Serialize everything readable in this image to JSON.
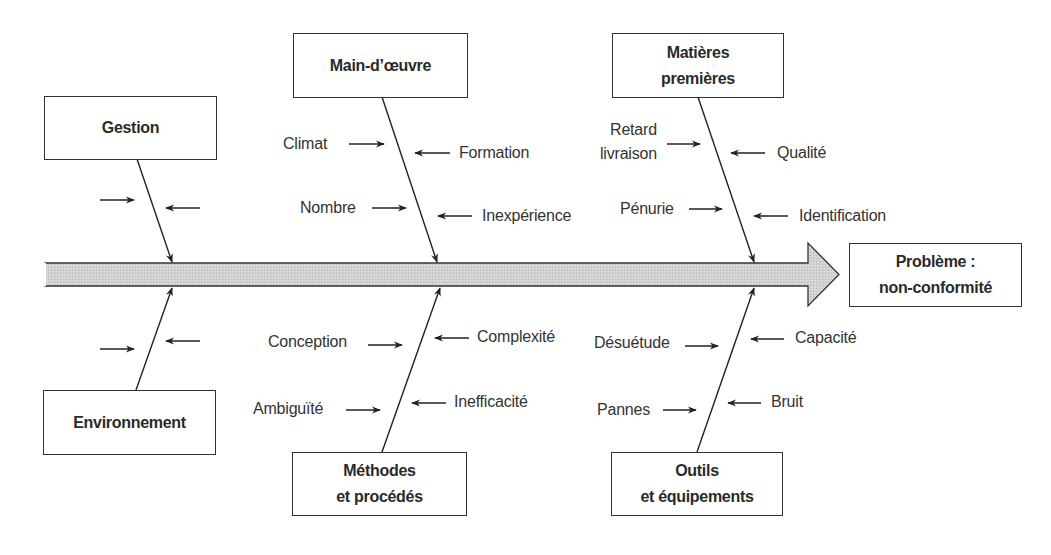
{
  "diagram": {
    "type": "ishikawa",
    "effect": {
      "label": "Problème :\nnon-conformité"
    },
    "spine_color": "#cfcfcf",
    "categories": [
      {
        "id": "gestion",
        "label": "Gestion",
        "position": "top",
        "causes_left": [
          ""
        ],
        "causes_right": [
          ""
        ]
      },
      {
        "id": "main-doeuvre",
        "label": "Main-d’œuvre",
        "position": "top",
        "causes_left": [
          "Climat",
          "Nombre"
        ],
        "causes_right": [
          "Formation",
          "Inexpérience"
        ]
      },
      {
        "id": "matieres-premieres",
        "label": "Matières\npremières",
        "position": "top",
        "causes_left": [
          "Retard\nlivraison",
          "Pénurie"
        ],
        "causes_right": [
          "Qualité",
          "Identification"
        ]
      },
      {
        "id": "environnement",
        "label": "Environnement",
        "position": "bottom",
        "causes_left": [
          ""
        ],
        "causes_right": [
          ""
        ]
      },
      {
        "id": "methodes",
        "label": "Méthodes\net procédés",
        "position": "bottom",
        "causes_left": [
          "Conception",
          "Ambiguïté"
        ],
        "causes_right": [
          "Complexité",
          "Inefficacité"
        ]
      },
      {
        "id": "outils",
        "label": "Outils\net équipements",
        "position": "bottom",
        "causes_left": [
          "Désuétude",
          "Pannes"
        ],
        "causes_right": [
          "Capacité",
          "Bruit"
        ]
      }
    ]
  }
}
